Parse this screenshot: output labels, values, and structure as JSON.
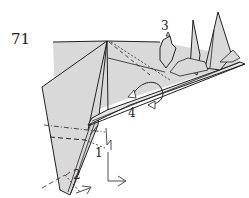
{
  "diagram": {
    "step_number": "71",
    "labels": [
      {
        "id": "1",
        "text": "1"
      },
      {
        "id": "2",
        "text": "2"
      },
      {
        "id": "3",
        "text": "3"
      },
      {
        "id": "4",
        "text": "4"
      }
    ],
    "colors": {
      "paper": "#d9d9d9",
      "line": "#222222",
      "background": "#ffffff"
    }
  }
}
